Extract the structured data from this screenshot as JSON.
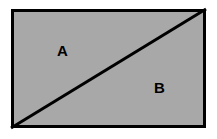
{
  "figure": {
    "name": "rectangle-divided-by-diagonal",
    "canvas": {
      "width": 217,
      "height": 139,
      "background_color": "#ffffff"
    },
    "rectangle": {
      "fill_color": "#a8a8a8",
      "stroke_color": "#000000",
      "stroke_width": 3,
      "x": 11,
      "y": 9,
      "width": 195,
      "height": 119
    },
    "diagonal": {
      "name": "diagonal-line",
      "stroke_color": "#000000",
      "stroke_width": 3,
      "from": "bottom-left",
      "to": "top-right",
      "x1": 0,
      "y1": 119,
      "x2": 195,
      "y2": 0
    },
    "labels": [
      {
        "id": "A",
        "text": "A",
        "region": "upper-left-triangle",
        "color": "#000000",
        "x": 57,
        "y": 43
      },
      {
        "id": "B",
        "text": "B",
        "region": "lower-right-triangle",
        "color": "#000000",
        "x": 154,
        "y": 80
      }
    ]
  }
}
